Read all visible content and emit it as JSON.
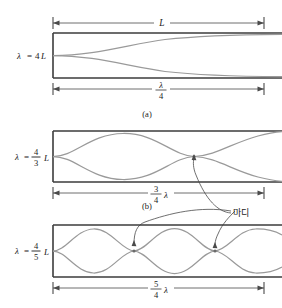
{
  "figure": {
    "colors": {
      "tube_border": "#3d3d3d",
      "wave": "#9a9a9a",
      "dimension_line": "#4a4a4a",
      "text": "#1a1a1a",
      "background": "#ffffff"
    }
  },
  "panels": [
    {
      "id": "a",
      "caption": "(a)",
      "wavelength_label": {
        "lambda": "λ",
        "equals": "=",
        "numerator": "4",
        "denominator": "",
        "coefficient": "4",
        "length_symbol": "L",
        "full": "λ = 4L",
        "is_fraction": false
      },
      "top_dimension": {
        "label": "L",
        "show": true
      },
      "bottom_dimension": {
        "numerator": "λ",
        "denominator": "4",
        "label": "λ/4",
        "is_fraction": true,
        "suffix": ""
      },
      "harmonic_number": 1,
      "antinode_loops": 0.5
    },
    {
      "id": "b",
      "caption": "(b)",
      "wavelength_label": {
        "lambda": "λ",
        "equals": "=",
        "numerator": "4",
        "denominator": "3",
        "length_symbol": "L",
        "full": "λ = 4/3 L",
        "is_fraction": true
      },
      "top_dimension": {
        "label": "",
        "show": false
      },
      "bottom_dimension": {
        "numerator": "3",
        "denominator": "4",
        "suffix": "λ",
        "label": "3/4 λ",
        "is_fraction": true
      },
      "harmonic_number": 3,
      "antinode_loops": 1.5
    },
    {
      "id": "c",
      "caption": "",
      "wavelength_label": {
        "lambda": "λ",
        "equals": "=",
        "numerator": "4",
        "denominator": "5",
        "length_symbol": "L",
        "full": "λ = 4/5 L",
        "is_fraction": true
      },
      "top_dimension": {
        "label": "",
        "show": false
      },
      "bottom_dimension": {
        "numerator": "5",
        "denominator": "4",
        "suffix": "λ",
        "label": "5/4 λ",
        "is_fraction": true
      },
      "harmonic_number": 5,
      "antinode_loops": 2.5
    }
  ],
  "annotations": {
    "node_label": "마디",
    "node_label_meaning": "node"
  }
}
